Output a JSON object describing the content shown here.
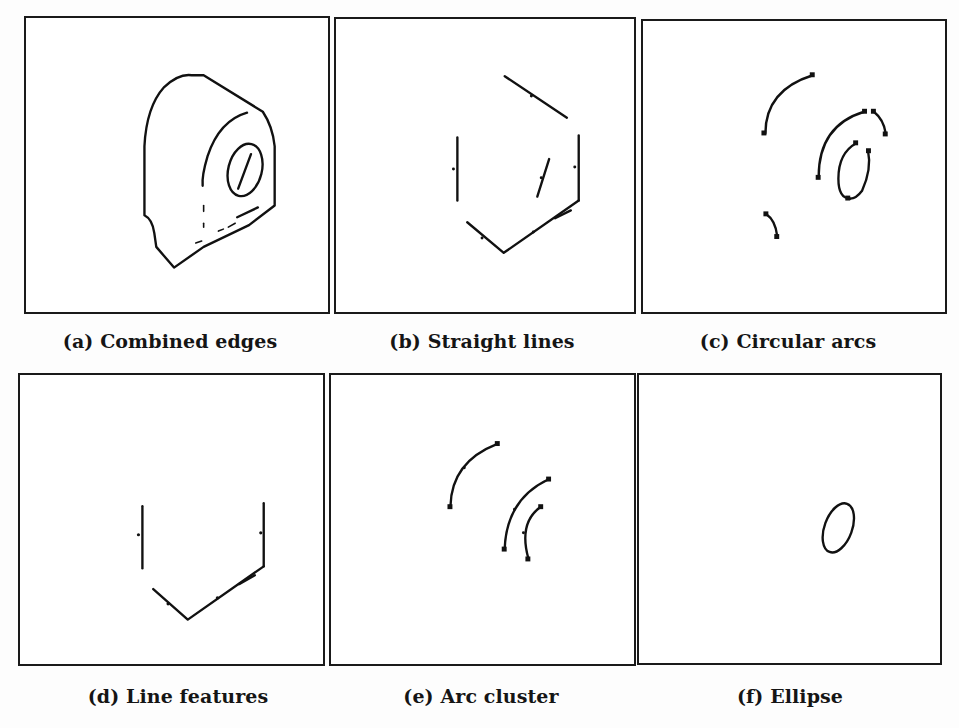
{
  "figure": {
    "panels": [
      {
        "id": "a",
        "label": "(a)",
        "caption": "Combined edges"
      },
      {
        "id": "b",
        "label": "(b)",
        "caption": "Straight lines"
      },
      {
        "id": "c",
        "label": "(c)",
        "caption": "Circular arcs"
      },
      {
        "id": "d",
        "label": "(d)",
        "caption": "Line features"
      },
      {
        "id": "e",
        "label": "(e)",
        "caption": "Arc cluster"
      },
      {
        "id": "f",
        "label": "(f)",
        "caption": "Ellipse"
      }
    ]
  }
}
